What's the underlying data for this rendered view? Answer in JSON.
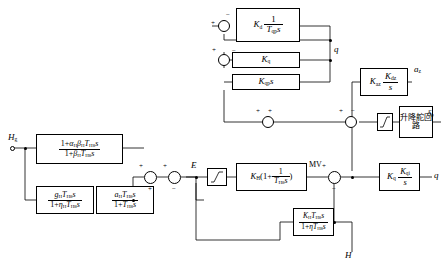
{
  "diagram": {
    "blocks": [
      {
        "id": "kd_tqp",
        "name": "block-kd-over-tqps",
        "text": "Kd 1/(Tqp s)"
      },
      {
        "id": "kq",
        "name": "block-kq",
        "text": "Kq"
      },
      {
        "id": "kqp",
        "name": "block-kqp-s",
        "text": "Kqp s"
      },
      {
        "id": "kaz",
        "name": "block-kaz-kdz-over-s",
        "text": "Kaz (Kdz/s)"
      },
      {
        "id": "lead_lag",
        "name": "block-lead-lag-hg",
        "text": "(1+aH bH TH8 s)/(1+bH TH8 s)"
      },
      {
        "id": "gh",
        "name": "block-gh-th8s",
        "text": "gH TH8 s/(1+nH TH8 s)"
      },
      {
        "id": "ah",
        "name": "block-ah-th8s",
        "text": "aH TH8 s/(1+TH8 s)"
      },
      {
        "id": "kh",
        "name": "block-kh-pi",
        "text": "KH (1 + 1/(TH8 s))"
      },
      {
        "id": "kqi",
        "name": "block-kq-kqi-over-s",
        "text": "Kq (Kqi/s)"
      },
      {
        "id": "kh_tH8",
        "name": "block-kh-th8s-over-1-eta",
        "text": "KH TH8 s/(1+eta TH8 s)"
      },
      {
        "id": "actuator",
        "name": "block-elevator-loop",
        "text": "升降舵回路"
      }
    ],
    "signals": {
      "q_top": "q",
      "q_right": "q",
      "az": "a",
      "az_sub": "z",
      "delta": "δ",
      "delta_sub": "e",
      "Hg": "H",
      "Hg_sub": "g",
      "E": "E",
      "MV": "MV",
      "H": "H"
    },
    "block_text": {
      "kd": "K",
      "kd_sub": "d",
      "kd_num": "1",
      "kd_den": "T",
      "kd_den_sub": "qp",
      "kd_den_s": "s",
      "kq": "K",
      "kq_sub": "q",
      "kqp": "K",
      "kqp_sub": "qp",
      "kqp_s": "s",
      "kaz": "K",
      "kaz_sub": "az",
      "kdz": "K",
      "kdz_sub": "dz",
      "kdz_den": "s",
      "ll_num_1": "1+",
      "ll_num_a": "α",
      "ll_num_asub": "H",
      "ll_num_b": "β",
      "ll_num_bsub": "H",
      "ll_num_T": "T",
      "ll_num_Tsub": "H8",
      "ll_num_s": "s",
      "ll_den_1": "1+",
      "ll_den_b": "β",
      "ll_den_bsub": "H",
      "ll_den_T": "T",
      "ll_den_Tsub": "H8",
      "ll_den_s": "s",
      "gh_num_g": "g",
      "gh_num_gsub": "H",
      "gh_num_T": "T",
      "gh_num_Tsub": "H8",
      "gh_num_s": "s",
      "gh_den_1": "1+",
      "gh_den_e": "η",
      "gh_den_esub": "H",
      "gh_den_T": "T",
      "gh_den_Tsub": "H8",
      "gh_den_s": "s",
      "ah_num_a": "a",
      "ah_num_asub": "H",
      "ah_num_T": "T",
      "ah_num_Tsub": "H8",
      "ah_num_s": "s",
      "ah_den_1": "1+",
      "ah_den_T": "T",
      "ah_den_Tsub": "H8",
      "ah_den_s": "s",
      "kh": "K",
      "kh_sub": "H",
      "kh_one": "1+",
      "kh_num": "1",
      "kh_den_T": "T",
      "kh_den_Tsub": "H8",
      "kh_den_s": "s",
      "kqi_k": "K",
      "kqi_ksub": "q",
      "kqi_num": "K",
      "kqi_numsub": "qi",
      "kqi_den": "s",
      "khf_num_K": "K",
      "khf_num_Ksub": "H",
      "khf_num_T": "T",
      "khf_num_Tsub": "H8",
      "khf_num_s": "s",
      "khf_den_1": "1+",
      "khf_den_e": "η",
      "khf_den_T": "T",
      "khf_den_Tsub": "H8",
      "khf_den_s": "s",
      "actuator": "升降舵回路"
    },
    "signs": {
      "s1_plus": "+",
      "s1_minus": "−",
      "s2_plus": "+",
      "s2_minus": "−",
      "s3_plus": "+",
      "s3_plus2": "+",
      "s4_plus": "+",
      "s4_minus": "−",
      "s5_plus": "+",
      "s5_plus2": "+",
      "s6_plus": "+",
      "s6_minus": "−",
      "s7_plus": "+",
      "s7_minus": "−",
      "s8_plus": "+",
      "s8_plus2": "+"
    }
  }
}
